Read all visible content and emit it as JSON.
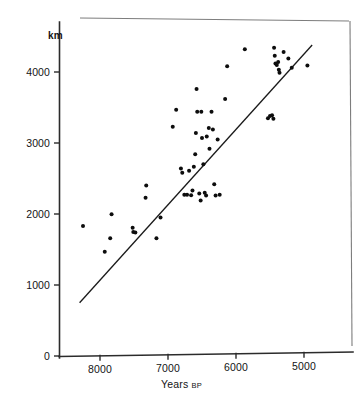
{
  "chart_data": {
    "type": "scatter",
    "title": "",
    "xlabel": "Years BP",
    "xlabel_main": "Years",
    "xlabel_small": "BP",
    "ylabel": "km",
    "xlim": [
      8500,
      4600
    ],
    "ylim": [
      0,
      4600
    ],
    "x_reversed": true,
    "grid": false,
    "legend": null,
    "xticks": [
      8000,
      7000,
      6000,
      5000
    ],
    "xtick_labels": [
      "8000",
      "7000",
      "6000",
      "5000"
    ],
    "yticks": [
      0,
      1000,
      2000,
      3000,
      4000
    ],
    "ytick_labels": [
      "0",
      "1000",
      "2000",
      "3000",
      "4000"
    ],
    "point_color": "#0d0d0d",
    "line_color": "#1a1a1a",
    "axis_color": "#2b2b2b",
    "trend_line": {
      "label": "regression line",
      "x_start": 8300,
      "y_start": 750,
      "x_end": 4880,
      "y_end": 4380
    },
    "points": [
      {
        "x": 8250,
        "y": 1830
      },
      {
        "x": 7930,
        "y": 1470
      },
      {
        "x": 7850,
        "y": 1660
      },
      {
        "x": 7830,
        "y": 1995
      },
      {
        "x": 7520,
        "y": 1805
      },
      {
        "x": 7510,
        "y": 1745
      },
      {
        "x": 7480,
        "y": 1740
      },
      {
        "x": 7330,
        "y": 2230
      },
      {
        "x": 7320,
        "y": 2400
      },
      {
        "x": 7170,
        "y": 1660
      },
      {
        "x": 7110,
        "y": 1950
      },
      {
        "x": 6930,
        "y": 3230
      },
      {
        "x": 6880,
        "y": 3470
      },
      {
        "x": 6810,
        "y": 2640
      },
      {
        "x": 6790,
        "y": 2580
      },
      {
        "x": 6760,
        "y": 2270
      },
      {
        "x": 6720,
        "y": 2270
      },
      {
        "x": 6690,
        "y": 2610
      },
      {
        "x": 6660,
        "y": 2265
      },
      {
        "x": 6640,
        "y": 2330
      },
      {
        "x": 6620,
        "y": 2665
      },
      {
        "x": 6600,
        "y": 2840
      },
      {
        "x": 6590,
        "y": 3140
      },
      {
        "x": 6580,
        "y": 3760
      },
      {
        "x": 6570,
        "y": 3440
      },
      {
        "x": 6540,
        "y": 2290
      },
      {
        "x": 6520,
        "y": 2190
      },
      {
        "x": 6510,
        "y": 3440
      },
      {
        "x": 6500,
        "y": 3070
      },
      {
        "x": 6480,
        "y": 2700
      },
      {
        "x": 6460,
        "y": 2300
      },
      {
        "x": 6440,
        "y": 2260
      },
      {
        "x": 6430,
        "y": 3090
      },
      {
        "x": 6400,
        "y": 3210
      },
      {
        "x": 6390,
        "y": 2920
      },
      {
        "x": 6360,
        "y": 3440
      },
      {
        "x": 6340,
        "y": 3190
      },
      {
        "x": 6320,
        "y": 2420
      },
      {
        "x": 6300,
        "y": 2260
      },
      {
        "x": 6270,
        "y": 3050
      },
      {
        "x": 6240,
        "y": 2270
      },
      {
        "x": 6160,
        "y": 3620
      },
      {
        "x": 6130,
        "y": 4080
      },
      {
        "x": 5870,
        "y": 4320
      },
      {
        "x": 5530,
        "y": 3350
      },
      {
        "x": 5500,
        "y": 3380
      },
      {
        "x": 5470,
        "y": 3390
      },
      {
        "x": 5450,
        "y": 3340
      },
      {
        "x": 5440,
        "y": 4340
      },
      {
        "x": 5430,
        "y": 4230
      },
      {
        "x": 5420,
        "y": 4120
      },
      {
        "x": 5400,
        "y": 4100
      },
      {
        "x": 5380,
        "y": 4140
      },
      {
        "x": 5370,
        "y": 4030
      },
      {
        "x": 5360,
        "y": 3990
      },
      {
        "x": 5300,
        "y": 4280
      },
      {
        "x": 5230,
        "y": 4190
      },
      {
        "x": 5180,
        "y": 4060
      },
      {
        "x": 4950,
        "y": 4090
      }
    ]
  }
}
